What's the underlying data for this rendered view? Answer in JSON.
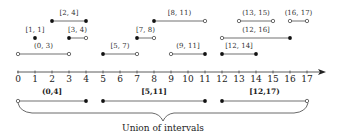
{
  "diagram": {
    "axis": {
      "ticks": [
        "0",
        "1",
        "2",
        "3",
        "4",
        "5",
        "6",
        "7",
        "8",
        "9",
        "10",
        "11",
        "12",
        "13",
        "14",
        "15",
        "16",
        "17"
      ],
      "min": 0,
      "max": 17,
      "arrow": true
    },
    "intervals": [
      {
        "label": "[2, 4]",
        "start": 2,
        "end": 4,
        "left": "closed",
        "right": "closed",
        "row": 0
      },
      {
        "label": "[8, 11)",
        "start": 8,
        "end": 11,
        "left": "closed",
        "right": "open",
        "row": 0
      },
      {
        "label": "(13, 15)",
        "start": 13,
        "end": 15,
        "left": "open",
        "right": "open",
        "row": 0
      },
      {
        "label": "(16, 17)",
        "start": 16,
        "end": 17,
        "left": "open",
        "right": "open",
        "row": 0
      },
      {
        "label": "[1, 1]",
        "start": 1,
        "end": 1,
        "left": "closed",
        "right": "closed",
        "row": 1
      },
      {
        "label": "[3, 4)",
        "start": 3,
        "end": 4,
        "left": "closed",
        "right": "open",
        "row": 1
      },
      {
        "label": "[7, 8)",
        "start": 7,
        "end": 8,
        "left": "closed",
        "right": "open",
        "row": 1
      },
      {
        "label": "(12, 16]",
        "start": 12,
        "end": 16,
        "left": "open",
        "right": "closed",
        "row": 1
      },
      {
        "label": "(0, 3)",
        "start": 0,
        "end": 3,
        "left": "open",
        "right": "open",
        "row": 2
      },
      {
        "label": "[5, 7)",
        "start": 5,
        "end": 7,
        "left": "closed",
        "right": "open",
        "row": 2
      },
      {
        "label": "(9, 11]",
        "start": 9,
        "end": 11,
        "left": "open",
        "right": "closed",
        "row": 2
      },
      {
        "label": "[12, 14]",
        "start": 12,
        "end": 14,
        "left": "closed",
        "right": "closed",
        "row": 2
      }
    ],
    "union": [
      {
        "label": "(0,4]",
        "start": 0,
        "end": 4,
        "left": "open",
        "right": "closed"
      },
      {
        "label": "[5,11]",
        "start": 5,
        "end": 11,
        "left": "closed",
        "right": "closed"
      },
      {
        "label": "[12,17)",
        "start": 12,
        "end": 17,
        "left": "closed",
        "right": "open"
      }
    ],
    "caption": "Union of intervals"
  }
}
